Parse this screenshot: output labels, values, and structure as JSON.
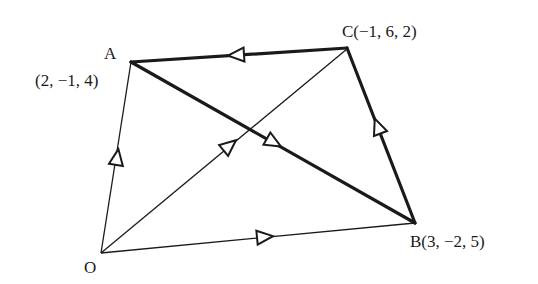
{
  "diagram": {
    "type": "vector-quadrilateral",
    "points": {
      "O": {
        "label": "O",
        "coords": ""
      },
      "A": {
        "label": "A",
        "coords": "(2, −1, 4)"
      },
      "B": {
        "label": "B(3, −2, 5)",
        "coords": "(3, −2, 5)"
      },
      "C": {
        "label": "C(−1, 6, 2)",
        "coords": "(−1, 6, 2)"
      }
    },
    "edges": [
      {
        "from": "O",
        "to": "A",
        "style": "thin",
        "arrow": "toward A"
      },
      {
        "from": "O",
        "to": "C",
        "style": "thin",
        "arrow": "toward C"
      },
      {
        "from": "O",
        "to": "B",
        "style": "thin",
        "arrow": "toward B"
      },
      {
        "from": "A",
        "to": "B",
        "style": "thick",
        "arrow": "toward B"
      },
      {
        "from": "B",
        "to": "C",
        "style": "thick",
        "arrow": "toward C"
      },
      {
        "from": "C",
        "to": "A",
        "style": "thick",
        "arrow": "toward A"
      }
    ],
    "colors": {
      "line": "#1a1a1a",
      "background": "#ffffff"
    }
  }
}
